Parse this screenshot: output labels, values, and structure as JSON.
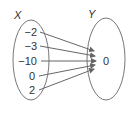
{
  "diagram": {
    "type": "mapping",
    "domain_label": "X",
    "range_label": "Y",
    "domain_values": [
      "−2",
      "−3",
      "−10",
      "0",
      "2"
    ],
    "range_values": [
      "0"
    ],
    "mappings": [
      {
        "from": "−2",
        "to": "0"
      },
      {
        "from": "−3",
        "to": "0"
      },
      {
        "from": "−10",
        "to": "0"
      },
      {
        "from": "0",
        "to": "0"
      },
      {
        "from": "2",
        "to": "0"
      }
    ],
    "colors": {
      "stroke": "#666666",
      "text": "#333333"
    }
  }
}
